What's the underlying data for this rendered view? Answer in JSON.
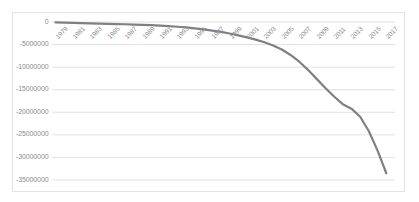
{
  "chart_data": {
    "type": "line",
    "title": "",
    "subtitle": "",
    "xlabel": "",
    "ylabel": "",
    "grid": true,
    "grid_axis": "y",
    "legend": false,
    "legend_position": "none",
    "line_color": "#7f7f86",
    "line_width": 2.2,
    "axis_color": "#d9d9d9",
    "tick_label_color": "#8c8c8c",
    "plot_background": "#ffffff",
    "xlim": [
      1979,
      2018
    ],
    "ylim": [
      -35000000,
      0
    ],
    "yticks": [
      0,
      -5000000,
      -10000000,
      -15000000,
      -20000000,
      -25000000,
      -30000000,
      -35000000
    ],
    "ytick_labels": [
      "0",
      "-5000000",
      "-10000000",
      "-15000000",
      "-20000000",
      "-25000000",
      "-30000000",
      "-35000000"
    ],
    "xticks": [
      1979,
      1981,
      1983,
      1985,
      1987,
      1989,
      1991,
      1993,
      1995,
      1997,
      1999,
      2001,
      2003,
      2005,
      2007,
      2009,
      2011,
      2013,
      2015,
      2017
    ],
    "xtick_labels": [
      "1979",
      "1981",
      "1983",
      "1985",
      "1987",
      "1989",
      "1991",
      "1993",
      "1995",
      "1997",
      "1999",
      "2001",
      "2003",
      "2005",
      "2007",
      "2009",
      "2011",
      "2013",
      "2015",
      "2017"
    ],
    "xtick_rotation": -45,
    "series": [
      {
        "name": "series-1",
        "x": [
          1979,
          1980,
          1981,
          1982,
          1983,
          1984,
          1985,
          1986,
          1987,
          1988,
          1989,
          1990,
          1991,
          1992,
          1993,
          1994,
          1995,
          1996,
          1997,
          1998,
          1999,
          2000,
          2001,
          2002,
          2003,
          2004,
          2005,
          2006,
          2007,
          2008,
          2009,
          2010,
          2011,
          2012,
          2013,
          2014,
          2015,
          2016,
          2017
        ],
        "values": [
          -100000,
          -150000,
          -200000,
          -250000,
          -300000,
          -350000,
          -400000,
          -450000,
          -500000,
          -560000,
          -620000,
          -700000,
          -800000,
          -900000,
          -1050000,
          -1200000,
          -1400000,
          -1650000,
          -1900000,
          -2200000,
          -2550000,
          -2950000,
          -3400000,
          -3900000,
          -4500000,
          -5200000,
          -6100000,
          -7300000,
          -8800000,
          -10600000,
          -12600000,
          -14600000,
          -16500000,
          -18200000,
          -19200000,
          -21000000,
          -24200000,
          -28500000,
          -33500000
        ]
      }
    ]
  }
}
